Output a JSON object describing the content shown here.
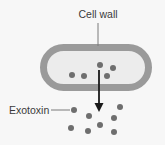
{
  "labels": {
    "cell_wall": "Cell wall",
    "exotoxin": "Exotoxin"
  },
  "colors": {
    "background": "#f7f7f7",
    "cell_wall": "#9a9a9a",
    "cell_interior": "#ececec",
    "dot": "#6e6e6e",
    "arrow": "#1a1a1a",
    "leader_line": "#7a7a7a",
    "text": "#3a3a3a"
  },
  "cell": {
    "x": 40,
    "y": 44,
    "width": 112,
    "height": 47,
    "wall_thickness": 7
  },
  "inside_dots": [
    {
      "x": 72,
      "y": 75
    },
    {
      "x": 84,
      "y": 76
    },
    {
      "x": 100,
      "y": 65
    },
    {
      "x": 113,
      "y": 68
    },
    {
      "x": 107,
      "y": 76
    }
  ],
  "outside_dots": [
    {
      "x": 74,
      "y": 110
    },
    {
      "x": 89,
      "y": 116
    },
    {
      "x": 120,
      "y": 107
    },
    {
      "x": 114,
      "y": 118
    },
    {
      "x": 100,
      "y": 125
    },
    {
      "x": 71,
      "y": 128
    },
    {
      "x": 88,
      "y": 131
    },
    {
      "x": 114,
      "y": 132
    }
  ],
  "arrow": {
    "x": 99,
    "y1": 70,
    "y2": 112
  }
}
